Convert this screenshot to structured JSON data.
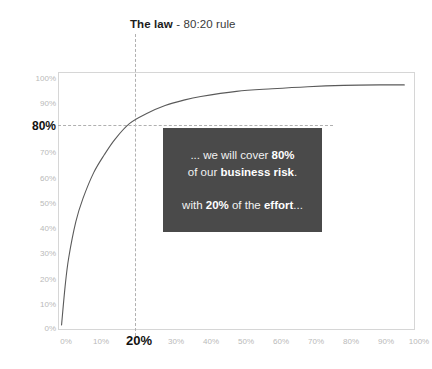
{
  "title": {
    "strong": "The law",
    "rest": " - 80:20 rule"
  },
  "chart_data": {
    "type": "line",
    "title": "The law - 80:20 rule",
    "xlabel": "",
    "ylabel": "",
    "xlim": [
      0,
      100
    ],
    "ylim": [
      0,
      100
    ],
    "grid": false,
    "legend": "none",
    "x_ticks": [
      "0%",
      "10%",
      "20%",
      "30%",
      "40%",
      "50%",
      "60%",
      "70%",
      "80%",
      "90%",
      "100%"
    ],
    "y_ticks": [
      "0%",
      "10%",
      "20%",
      "30%",
      "40%",
      "50%",
      "60%",
      "70%",
      "80%",
      "90%",
      "100%"
    ],
    "highlight_x_tick": "20%",
    "highlight_y_tick": "80%",
    "series": [
      {
        "name": "Pareto cumulative curve",
        "x": [
          1,
          2,
          3,
          5,
          7,
          10,
          13,
          16,
          20,
          25,
          30,
          35,
          40,
          50,
          60,
          70,
          80,
          90,
          97
        ],
        "values": [
          2,
          17,
          28,
          42,
          51,
          61,
          68,
          74,
          80,
          84,
          87,
          89,
          90.5,
          92.5,
          93.5,
          94.3,
          94.8,
          95,
          95
        ]
      }
    ],
    "annotations": [
      {
        "type": "vline",
        "x": 20,
        "label": "20%",
        "style": "dashed"
      },
      {
        "type": "hline",
        "y": 80,
        "label": "80%",
        "style": "dashed"
      },
      {
        "type": "callout",
        "x": 20,
        "y": 80,
        "text": "... we will cover 80% of our business risk. with 20% of the effort..."
      }
    ]
  },
  "callout": {
    "line1_pre": "... we will cover ",
    "line1_bold": "80%",
    "line2_pre": "of our ",
    "line2_bold": "business risk",
    "line2_post": ".",
    "line3_pre": "with ",
    "line3_bold1": "20%",
    "line3_mid": " of the ",
    "line3_bold2": "effort",
    "line3_post": "..."
  },
  "colors": {
    "callout_bg": "#4a4a4a",
    "curve": "#5a5a5a",
    "frame": "#d6d6d6",
    "tick_muted": "#b9b9b9",
    "tick_highlight": "#111111",
    "guide": "#b0b0b0"
  }
}
